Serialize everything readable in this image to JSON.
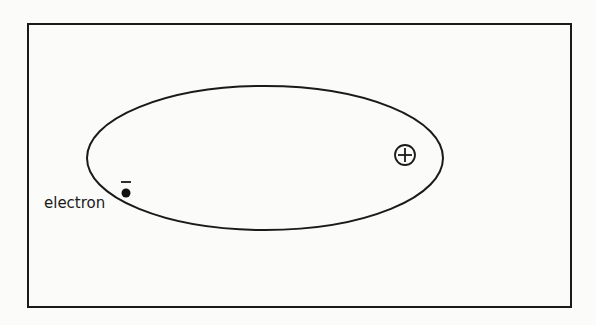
{
  "diagram": {
    "title": "",
    "frame": {
      "x": 28,
      "y": 24,
      "width": 543,
      "height": 283,
      "stroke": "#1a1a1a"
    },
    "orbit": {
      "cx": 265,
      "cy": 158,
      "rx": 178,
      "ry": 72,
      "stroke": "#1a1a1a"
    },
    "nucleus": {
      "cx": 405,
      "cy": 155,
      "r": 10,
      "symbol": "+",
      "charge": "positive"
    },
    "electron": {
      "cx": 126,
      "cy": 193,
      "r": 4.5,
      "charge_symbol": "–",
      "label": "electron"
    }
  }
}
